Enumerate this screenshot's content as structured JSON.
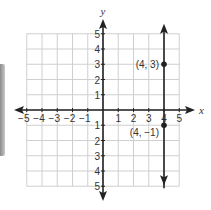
{
  "chart_data": {
    "type": "line",
    "title": "",
    "xlabel": "x",
    "ylabel": "y",
    "xlim": [
      -5,
      5
    ],
    "ylim": [
      -5,
      5
    ],
    "grid": true,
    "x_ticks": [
      "-5",
      "-4",
      "-3",
      "-2",
      "-1",
      "1",
      "2",
      "3",
      "4",
      "5"
    ],
    "y_ticks_positive": [
      "1",
      "2",
      "3",
      "4",
      "5"
    ],
    "y_ticks_negative": [
      "1",
      "2",
      "3",
      "4",
      "5"
    ],
    "series": [
      {
        "name": "vertical line x = 4",
        "x": [
          4,
          4
        ],
        "y": [
          -5,
          5
        ],
        "arrows": "both"
      }
    ],
    "points": [
      {
        "x": 4,
        "y": 3,
        "label": "(4, 3)"
      },
      {
        "x": 4,
        "y": -1,
        "label": "(4, −1)"
      }
    ],
    "colors": {
      "grid": "#cfcfcf",
      "axis": "#222222",
      "line": "#222222"
    }
  }
}
